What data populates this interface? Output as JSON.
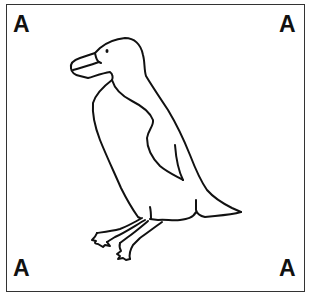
{
  "figure": {
    "corner_labels": {
      "top_left": "A",
      "top_right": "A",
      "bottom_left": "A",
      "bottom_right": "A"
    },
    "colors": {
      "line": "#111111",
      "border": "#333333",
      "background": "#ffffff"
    }
  }
}
